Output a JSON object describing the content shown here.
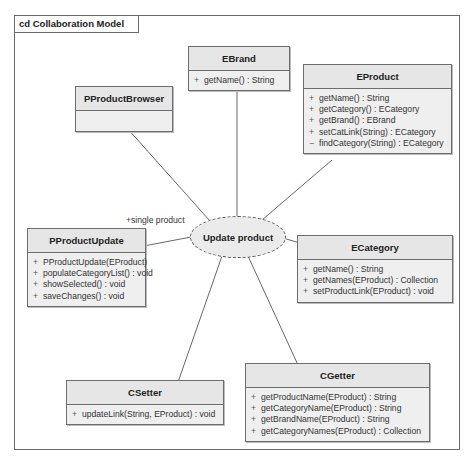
{
  "diagram": {
    "frame_title": "cd Collaboration Model",
    "use_case": {
      "label": "Update product"
    },
    "role_label": "+single product",
    "classes": [
      {
        "id": "ebrand",
        "name": "EBrand",
        "operations": [
          {
            "vis": "+",
            "sig": "getName() : String"
          }
        ]
      },
      {
        "id": "pproductbrowser",
        "name": "PProductBrowser",
        "operations": []
      },
      {
        "id": "eproduct",
        "name": "EProduct",
        "operations": [
          {
            "vis": "+",
            "sig": "getName() : String"
          },
          {
            "vis": "+",
            "sig": "getCategory() : ECategory"
          },
          {
            "vis": "+",
            "sig": "getBrand() : EBrand"
          },
          {
            "vis": "+",
            "sig": "setCatLink(String) : ECategory"
          },
          {
            "vis": "−",
            "sig": "findCategory(String) : ECategory"
          }
        ]
      },
      {
        "id": "pproductupdate",
        "name": "PProductUpdate",
        "operations": [
          {
            "vis": "+",
            "sig": "PProductUpdate(EProduct)"
          },
          {
            "vis": "+",
            "sig": "populateCategoryList() : void"
          },
          {
            "vis": "+",
            "sig": "showSelected() : void"
          },
          {
            "vis": "+",
            "sig": "saveChanges() : void"
          }
        ]
      },
      {
        "id": "ecategory",
        "name": "ECategory",
        "operations": [
          {
            "vis": "+",
            "sig": "getName() : String"
          },
          {
            "vis": "+",
            "sig": "getNames(EProduct) : Collection"
          },
          {
            "vis": "+",
            "sig": "setProductLink(EProduct) : void"
          }
        ]
      },
      {
        "id": "csetter",
        "name": "CSetter",
        "operations": [
          {
            "vis": "+",
            "sig": "updateLink(String, EProduct) : void"
          }
        ]
      },
      {
        "id": "cgetter",
        "name": "CGetter",
        "operations": [
          {
            "vis": "+",
            "sig": "getProductName(EProduct) : String"
          },
          {
            "vis": "+",
            "sig": "getCategoryName(EProduct) : String"
          },
          {
            "vis": "+",
            "sig": "getBrandName(EProduct) : String"
          },
          {
            "vis": "+",
            "sig": "getCategoryNames(EProduct) : Collection"
          }
        ]
      }
    ],
    "connections": [
      {
        "from": "Update product",
        "to": "EBrand"
      },
      {
        "from": "Update product",
        "to": "PProductBrowser"
      },
      {
        "from": "Update product",
        "to": "EProduct"
      },
      {
        "from": "Update product",
        "to": "PProductUpdate",
        "role": "+single product"
      },
      {
        "from": "Update product",
        "to": "ECategory"
      },
      {
        "from": "Update product",
        "to": "CSetter"
      },
      {
        "from": "Update product",
        "to": "CGetter"
      }
    ]
  }
}
